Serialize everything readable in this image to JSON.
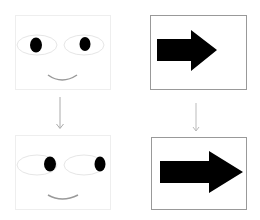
{
  "diagram": {
    "panels": [
      {
        "id": "face-original",
        "type": "face",
        "position": "top-left",
        "gaze": "center"
      },
      {
        "id": "arrow-original",
        "type": "arrow",
        "position": "top-right",
        "direction": "right"
      },
      {
        "id": "face-transformed",
        "type": "face",
        "position": "bottom-left",
        "gaze": "right"
      },
      {
        "id": "arrow-transformed",
        "type": "arrow",
        "position": "bottom-right",
        "direction": "right",
        "size": "larger"
      }
    ],
    "connectors": [
      {
        "from": "face-original",
        "to": "face-transformed",
        "icon": "down-arrow-icon"
      },
      {
        "from": "arrow-original",
        "to": "arrow-transformed",
        "icon": "down-arrow-icon"
      }
    ],
    "colors": {
      "face_border": "#eeeeee",
      "arrow_box_border": "#999999",
      "pupil": "#000000",
      "eye_outline": "#e6e6e6",
      "mouth": "#999999",
      "connector": "#aaaaaa",
      "arrow_fill": "#000000"
    }
  }
}
